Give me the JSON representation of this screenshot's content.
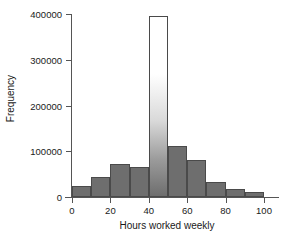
{
  "chart_data": {
    "type": "bar",
    "title": "",
    "subtitle": "",
    "xlabel": "Hours worked weekly",
    "ylabel": "Frequency",
    "xlim": [
      0,
      100
    ],
    "ylim": [
      0,
      400000
    ],
    "grid": false,
    "legend": null,
    "bin_width": 10,
    "categories": [
      "0-10",
      "10-20",
      "20-30",
      "30-40",
      "40-50",
      "50-60",
      "60-70",
      "70-80",
      "80-90",
      "90-100"
    ],
    "bin_edges": [
      0,
      10,
      20,
      30,
      40,
      50,
      60,
      70,
      80,
      90,
      100
    ],
    "values": [
      23000,
      44000,
      72000,
      65000,
      395000,
      111000,
      80000,
      33000,
      17000,
      11000
    ],
    "xticks": [
      0,
      20,
      40,
      60,
      80,
      100
    ],
    "xtick_labels": [
      "0",
      "20",
      "40",
      "60",
      "80",
      "100"
    ],
    "yticks": [
      0,
      100000,
      200000,
      300000,
      400000
    ],
    "ytick_labels": [
      "0",
      "100000",
      "200000",
      "300000",
      "400000"
    ],
    "bar_fill_color": "#6e6e6e",
    "bar_edge_color": "#4a4a4a",
    "highlight_bin_index": 4,
    "highlight_fill": "gradient-white-to-gray",
    "background_color": "#ffffff"
  }
}
